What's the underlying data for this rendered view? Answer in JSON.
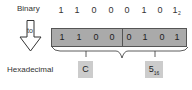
{
  "labels": {
    "binary": "Binary",
    "to": "to",
    "hexadecimal": "Hexadecimal"
  },
  "binary_digits": [
    "1",
    "1",
    "0",
    "0",
    "0",
    "1",
    "0",
    "1"
  ],
  "binary_subscript": "2",
  "groups": [
    {
      "bits": [
        "1",
        "1",
        "0",
        "0"
      ],
      "hex": "C"
    },
    {
      "bits": [
        "0",
        "1",
        "0",
        "1"
      ],
      "hex": "5",
      "subscript": "16"
    }
  ],
  "colors": {
    "box_fill": "#aaaaaa",
    "hex_fill": "#cccccc"
  }
}
